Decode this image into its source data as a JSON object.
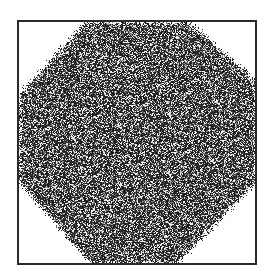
{
  "figure": {
    "frame_color": "#2a2a2a",
    "background_color": "#ffffff",
    "speckle_dark": "#1a1a1a",
    "speckle_light": "#ffffff",
    "shape": "octagon"
  }
}
